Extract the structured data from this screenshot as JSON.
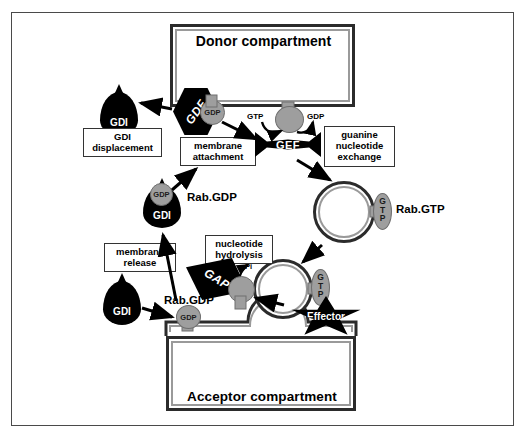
{
  "figure": {
    "colors": {
      "protein_black": "#000000",
      "nucleotide_gray": "#9e9e9e",
      "membrane_dark": "#2b2b2b",
      "membrane_light": "#9a9a9a",
      "background": "#ffffff",
      "frame": "#4a4a4a"
    }
  },
  "compartments": {
    "donor": "Donor compartment",
    "acceptor": "Acceptor compartment"
  },
  "process_labels": {
    "gdi_displacement": "GDI\ndisplacement",
    "gdi_displacement_line1": "GDI",
    "gdi_displacement_line2": "displacement",
    "membrane_attachment_line1": "membrane",
    "membrane_attachment_line2": "attachment",
    "guanine_exchange_line1": "guanine",
    "guanine_exchange_line2": "nucleotide",
    "guanine_exchange_line3": "exchange",
    "nucleotide_hydrolysis_line1": "nucleotide",
    "nucleotide_hydrolysis_line2": "hydrolysis",
    "membrane_release_line1": "membrane",
    "membrane_release_line2": "release"
  },
  "proteins": {
    "gdf": "GDF",
    "gef": "GEF",
    "gap": "GAP",
    "effector": "Effector",
    "gdi": "GDI"
  },
  "nucleotides": {
    "gdp": "GDP",
    "gtp": "GTP",
    "gtp_stacked_g": "G",
    "gtp_stacked_t": "T",
    "gtp_stacked_p": "P",
    "pi": "Pi"
  },
  "complex_labels": {
    "rab_gdp_cytosolic": "Rab.GDP",
    "rab_gtp_vesicle": "Rab.GTP",
    "rab_gdp_membrane": "Rab.GDP"
  },
  "states": [
    {
      "name": "gdi-bound-rab-gdp",
      "label": "Rab.GDP",
      "bound": "GDI",
      "nucleotide": "GDP"
    },
    {
      "name": "membrane-rab-gdp",
      "label": "Rab.GDP",
      "bound": "GDF",
      "nucleotide": "GDP"
    },
    {
      "name": "vesicle-rab-gtp",
      "label": "Rab.GTP",
      "bound": "Effector",
      "nucleotide": "GTP"
    }
  ]
}
